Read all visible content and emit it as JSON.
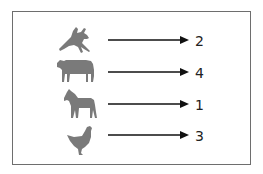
{
  "diagram": {
    "type": "mapping",
    "icon_color": "#7a7a7a",
    "arrow_color": "#111111",
    "border_color": "#6e6e6e",
    "rows": [
      {
        "animal": "rabbit",
        "icon": "rabbit-icon",
        "value": "2"
      },
      {
        "animal": "cow",
        "icon": "cow-icon",
        "value": "4"
      },
      {
        "animal": "horse",
        "icon": "horse-icon",
        "value": "1"
      },
      {
        "animal": "chicken",
        "icon": "chicken-icon",
        "value": "3"
      }
    ]
  }
}
